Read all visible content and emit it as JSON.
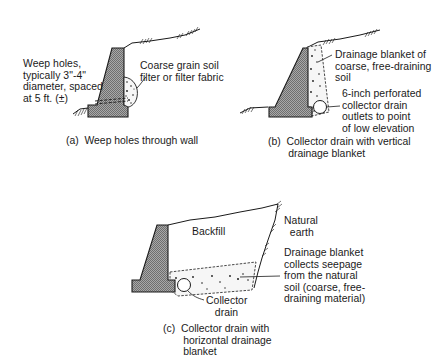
{
  "figure": {
    "panels": [
      {
        "id": "a",
        "caption": "(a)  Weep holes through wall",
        "labels": {
          "weep_holes": "Weep holes,\ntypically 3\"-4\"\ndiameter, spaced\nat 5 ft. (±)",
          "filter": "Coarse grain soil\nfilter or filter fabric"
        }
      },
      {
        "id": "b",
        "caption": "(b)  Collector drain with vertical\n       drainage blanket",
        "labels": {
          "blanket": "Drainage blanket of\ncoarse, free-draining\nsoil",
          "collector": "6-inch perforated\ncollector drain\noutlets to point\nof low elevation"
        }
      },
      {
        "id": "c",
        "caption": "(c)  Collector drain with\n       horizontal drainage\n       blanket",
        "labels": {
          "backfill": "Backfill",
          "natural_earth": "Natural\n  earth",
          "blanket": "Drainage blanket\ncollects seepage\nfrom the natural\nsoil (coarse, free-\ndraining material)",
          "collector": "Collector\n   drain"
        }
      }
    ],
    "colors": {
      "line": "#1a1a1a",
      "wall_fill": "#9a9a9a",
      "gravel_fill": "#f4f4f4",
      "background": "#ffffff"
    }
  }
}
